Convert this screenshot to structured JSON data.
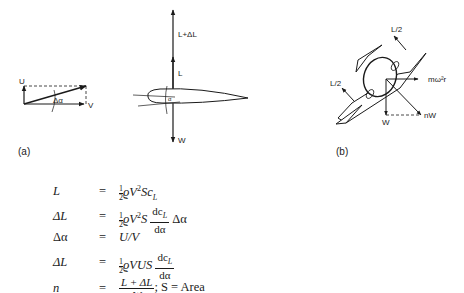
{
  "figure": {
    "panel_a": {
      "caption": "(a)",
      "velocity_triangle": {
        "labels": {
          "vertical": "U",
          "horizontal": "V",
          "angle": "Δα"
        }
      },
      "airfoil": {
        "labels": {
          "lift_plus": "L+ΔL",
          "lift": "L",
          "weight": "W",
          "angle": "α"
        }
      }
    },
    "panel_b": {
      "caption": "(b)",
      "labels": {
        "lift_upper": "L/2",
        "lift_lower": "L/2",
        "centrifugal": "mω²r",
        "weight": "W",
        "load": "nW"
      }
    }
  },
  "equations": [
    {
      "lhs": "L",
      "rhs_text": "½ϱV²Sc_L"
    },
    {
      "lhs": "ΔL",
      "rhs_text": "½ϱV²S (dc_L/dα) Δα"
    },
    {
      "lhs": "Δα",
      "rhs_text": "U/V"
    },
    {
      "lhs": "ΔL",
      "rhs_text": "½ϱVUS (dc_L/dα)"
    },
    {
      "lhs": "n",
      "rhs_text": "(L + ΔL)/W; S = Area"
    }
  ],
  "eq_parts": {
    "equals": "=",
    "half_num": "1",
    "half_den": "2",
    "rho": "ϱ",
    "V": "V",
    "two": "2",
    "S": "S",
    "c": "c",
    "L_sub": "L",
    "dcL": "dc",
    "dalpha": "dα",
    "dalpha_sym": "Δα",
    "UV": "U/V",
    "VUS": "VUS",
    "n_num": "L + ΔL",
    "n_den": "W",
    "area": "; S = Area",
    "lhs": [
      "L",
      "ΔL",
      "Δα",
      "ΔL",
      "n"
    ]
  }
}
